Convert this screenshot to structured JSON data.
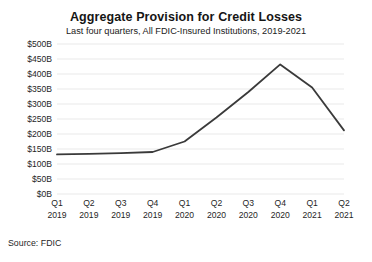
{
  "chart_data": {
    "type": "line",
    "title": "Aggregate Provision for Credit Losses",
    "subtitle": "Last four quarters, All FDIC-Insured Institutions, 2019-2021",
    "xlabel": "",
    "ylabel": "",
    "categories": [
      "Q1 2019",
      "Q2 2019",
      "Q3 2019",
      "Q4 2019",
      "Q1 2020",
      "Q2 2020",
      "Q3 2020",
      "Q4 2020",
      "Q1 2021",
      "Q2 2021"
    ],
    "x_tick_lines": [
      [
        "Q1",
        "2019"
      ],
      [
        "Q2",
        "2019"
      ],
      [
        "Q3",
        "2019"
      ],
      [
        "Q4",
        "2019"
      ],
      [
        "Q1",
        "2020"
      ],
      [
        "Q2",
        "2020"
      ],
      [
        "Q3",
        "2020"
      ],
      [
        "Q4",
        "2020"
      ],
      [
        "Q1",
        "2021"
      ],
      [
        "Q2",
        "2021"
      ]
    ],
    "values": [
      132,
      134,
      136,
      140,
      175,
      255,
      340,
      432,
      355,
      212
    ],
    "ylim": [
      0,
      500
    ],
    "ytick_values": [
      0,
      50,
      100,
      150,
      200,
      250,
      300,
      350,
      400,
      450,
      500
    ],
    "ytick_labels": [
      "$0B",
      "$50B",
      "$100B",
      "$150B",
      "$200B",
      "$250B",
      "$300B",
      "$350B",
      "$400B",
      "$450B",
      "$500B"
    ],
    "grid": true,
    "grid_color": "#e9e9e9",
    "legend": false,
    "legend_position": "none",
    "line_color": "#3a3a3a",
    "line_width": 1.8,
    "background_color": "#ffffff"
  },
  "source": {
    "text": "Source: FDIC"
  }
}
